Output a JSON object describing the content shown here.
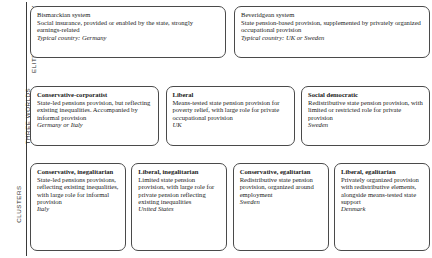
{
  "figure": {
    "rows": [
      {
        "id": "elite-philosophy",
        "label": "ELITE PHILOSOPHY",
        "boxes": [
          {
            "title": "Bismarckian system",
            "body": "Social insurance, provided or enabled by the state, strongly earnings-related",
            "country": "Typical country: Germany"
          },
          {
            "title": "Beveridgean system",
            "body": "State pension-based provision, supplemented by privately organized occupational provision",
            "country": "Typical country: UK or Sweden"
          }
        ]
      },
      {
        "id": "three-worlds",
        "label": "THREE WORLDS",
        "boxes": [
          {
            "title": "Conservative-corporatist",
            "body": "State-led pensions provision, but reflecting existing inequalities. Accompanied by informal provision",
            "country": "Germany or Italy"
          },
          {
            "title": "Liberal",
            "body": "Means-tested state pension provision for poverty relief, with large role for private occupational provision",
            "country": "UK"
          },
          {
            "title": "Social democratic",
            "body": "Redistributive state pension provision, with limited or restricted role for private provision",
            "country": "Sweden"
          }
        ]
      },
      {
        "id": "clusters",
        "label": "CLUSTERS",
        "boxes": [
          {
            "title": "Conservative, inegalitarian",
            "body": "State-led pensions provisions, reflecting existing inequalities, with large role for informal provision",
            "country": "Italy"
          },
          {
            "title": "Liberal, inegalitarian",
            "body": "Limited state pension provision, with large role for private pension reflecting existing inequalities",
            "country": "United States"
          },
          {
            "title": "Conservative, egalitarian",
            "body": "Redistributive state pension provision, organized around employment",
            "country": "Sweden"
          },
          {
            "title": "Liberal, egalitarian",
            "body": "Privately organized provision with redistributive elements, alongside means-tested state support",
            "country": "Denmark"
          }
        ]
      }
    ]
  }
}
